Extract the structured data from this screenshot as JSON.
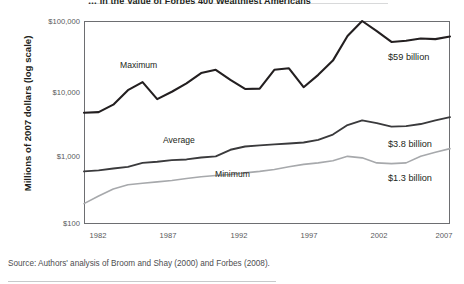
{
  "figure": {
    "title_partial": "… in the Value of Forbes 400 Wealthiest Americans",
    "source_note": "Source: Authors' analysis of Broom and Shay (2000) and Forbes (2008)."
  },
  "axis": {
    "y_label": "Millions of 2007 dollars (log scale)",
    "y_ticks": [
      "$100,000",
      "$10,000",
      "$1,000",
      "$100"
    ],
    "x_ticks": [
      "1982",
      "1987",
      "1992",
      "1997",
      "2002",
      "2007"
    ]
  },
  "annotations": {
    "maximum_label": "Maximum",
    "average_label": "Average",
    "minimum_label": "Minimum",
    "maximum_value": "$59 billion",
    "average_value": "$3.8 billion",
    "minimum_value": "$1.3 billion"
  },
  "colors": {
    "maximum_line": "#231f20",
    "average_line": "#3a3a3c",
    "minimum_line": "#a7a9ac",
    "frame": "#6d6e71",
    "tick_text": "#58595b"
  },
  "chart_data": {
    "type": "line",
    "title": "… in the Value of Forbes 400 Wealthiest Americans",
    "xlabel": "",
    "ylabel": "Millions of 2007 dollars (log scale)",
    "yscale": "log",
    "ylim": [
      100,
      100000
    ],
    "xlim": [
      1982,
      2007
    ],
    "grid": false,
    "legend": "inline-labels",
    "x": [
      1982,
      1983,
      1984,
      1985,
      1986,
      1987,
      1988,
      1989,
      1990,
      1991,
      1992,
      1993,
      1994,
      1995,
      1996,
      1997,
      1998,
      1999,
      2000,
      2001,
      2002,
      2003,
      2004,
      2005,
      2006,
      2007
    ],
    "series": [
      {
        "name": "Maximum",
        "color": "#231f20",
        "end_label": "$59 billion",
        "values": [
          4400,
          4500,
          5800,
          9500,
          12500,
          7000,
          9000,
          12000,
          17000,
          19000,
          13500,
          9900,
          10000,
          19000,
          20000,
          10500,
          16000,
          26000,
          60000,
          100000,
          71000,
          49000,
          51000,
          55000,
          54000,
          59000
        ]
      },
      {
        "name": "Average",
        "color": "#3a3a3c",
        "end_label": "$3.8 billion",
        "values": [
          600,
          620,
          660,
          700,
          800,
          830,
          880,
          900,
          960,
          1000,
          1250,
          1400,
          1450,
          1500,
          1550,
          1600,
          1750,
          2100,
          2900,
          3400,
          3100,
          2750,
          2800,
          3000,
          3400,
          3800
        ]
      },
      {
        "name": "Minimum",
        "color": "#a7a9ac",
        "end_label": "$1.3 billion",
        "values": [
          200,
          260,
          330,
          380,
          400,
          420,
          440,
          470,
          500,
          520,
          540,
          570,
          600,
          640,
          700,
          760,
          800,
          860,
          1000,
          950,
          800,
          780,
          800,
          1000,
          1150,
          1300
        ]
      }
    ]
  }
}
